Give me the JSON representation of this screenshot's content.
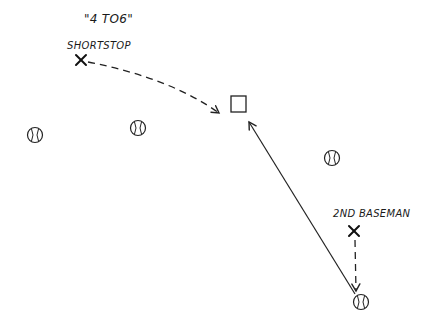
{
  "diagram": {
    "title": "\"4 TO6\"",
    "ink_color": "#222222",
    "background": "#ffffff",
    "players": [
      {
        "name": "shortstop",
        "label": "SHORTSTOP",
        "marker": "x-mark",
        "x": 81,
        "y": 60
      },
      {
        "name": "second-baseman",
        "label": "2ND BASEMAN",
        "marker": "x-mark",
        "x": 354,
        "y": 231
      }
    ],
    "baseballs": [
      {
        "x": 35,
        "y": 135
      },
      {
        "x": 138,
        "y": 128
      },
      {
        "x": 332,
        "y": 158
      },
      {
        "x": 361,
        "y": 302
      }
    ],
    "base": {
      "name": "second-base",
      "x": 231,
      "y": 96,
      "size": 15
    },
    "paths": [
      {
        "name": "shortstop-run-path",
        "style": "dashed",
        "from": [
          85,
          62
        ],
        "to": [
          219,
          113
        ]
      },
      {
        "name": "throw-path",
        "style": "solid",
        "from": [
          356,
          295
        ],
        "to": [
          248,
          121
        ]
      },
      {
        "name": "second-baseman-run-path",
        "style": "dashed",
        "from": [
          355,
          239
        ],
        "to": [
          356,
          291
        ]
      }
    ]
  }
}
